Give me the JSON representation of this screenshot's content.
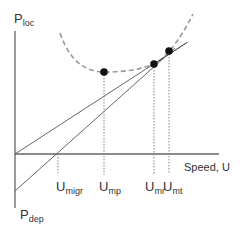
{
  "diagram": {
    "title": "",
    "axes": {
      "y_top_label": {
        "main": "P",
        "sub": "loc"
      },
      "y_bottom_label": {
        "main": "P",
        "sub": "dep"
      },
      "x_label": "Speed, U"
    },
    "markers": [
      {
        "main": "U",
        "sub": "migr"
      },
      {
        "main": "U",
        "sub": "mp"
      },
      {
        "main": "U",
        "sub": "mr"
      },
      {
        "main": "U",
        "sub": "mt"
      }
    ],
    "elements": {
      "power_curve": "dashed U-shaped locomotion power curve",
      "line_upper": "tangent line from origin to curve (U_mr)",
      "line_lower": "line from P_dep to curve (U_mt)",
      "points": [
        "minimum power point (U_mp)",
        "max range point (U_mr)",
        "tangent point (U_mt)"
      ]
    },
    "colors": {
      "axis": "#666666",
      "line": "#555555",
      "curve": "#999999",
      "point": "#111111",
      "guide": "#777777"
    }
  }
}
